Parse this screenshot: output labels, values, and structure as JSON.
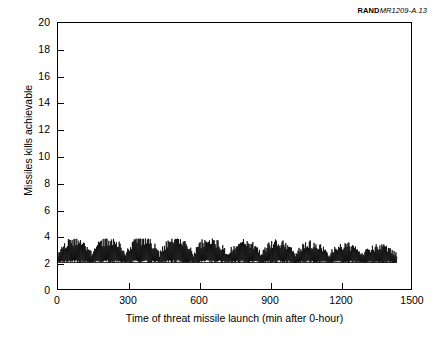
{
  "source_tag": {
    "mark": "RAND",
    "document": "MR1209-A.13"
  },
  "chart_data": {
    "type": "line",
    "title": "",
    "subtitle": "",
    "xlabel": "Time of threat missile launch (min after 0-hour)",
    "ylabel": "Missiles kills achievable",
    "xlim": [
      0,
      1500
    ],
    "ylim": [
      0,
      20
    ],
    "xticks": [
      0,
      300,
      600,
      900,
      1200,
      1500
    ],
    "yticks": [
      0,
      2,
      4,
      6,
      8,
      10,
      12,
      14,
      16,
      18,
      20
    ],
    "xtick_labels": [
      "0",
      "300",
      "600",
      "900",
      "1200",
      "1500"
    ],
    "ytick_labels": [
      "0",
      "2",
      "4",
      "6",
      "8",
      "10",
      "12",
      "14",
      "16",
      "18",
      "20"
    ],
    "grid": false,
    "legend": null,
    "legend_position": "none",
    "line_color": "#000000",
    "series": [
      {
        "name": "Missile kills achievable",
        "description": "High-frequency oscillating time series; baseline near 2 kills with rapid spikes grouped into repeating bursts peaking between 3.0 and 3.8 kills. Data spans 0 to 1440 minutes (24 hours).",
        "baseline": 2.0,
        "peak_max": 3.8,
        "peak_min": 1.9,
        "x_start": 0,
        "x_end": 1440,
        "sample_interval": 2,
        "burst_count": 10,
        "burst_period_min": 144
      }
    ],
    "annotations": []
  }
}
